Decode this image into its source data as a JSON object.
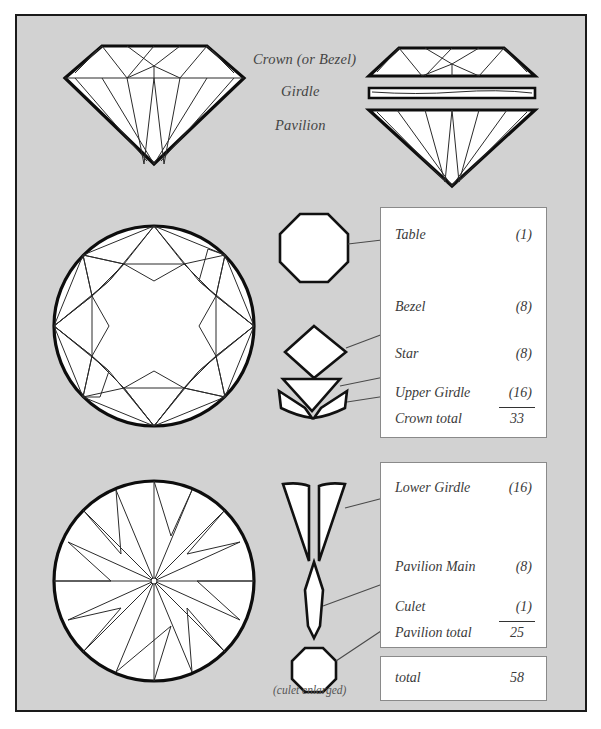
{
  "diagram": {
    "title_labels": {
      "crown": "Crown (or Bezel)",
      "girdle": "Girdle",
      "pavilion": "Pavilion"
    },
    "caption_culet": "(culet enlarged)",
    "background_color": "#d2d2d2",
    "frame_color": "#1a1a1a",
    "facet_fill": "#ffffff",
    "facet_stroke": "#0d0d0d"
  },
  "crown_table": {
    "rows": [
      {
        "name": "Table",
        "count": "(1)"
      },
      {
        "name": "Bezel",
        "count": "(8)"
      },
      {
        "name": "Star",
        "count": "(8)"
      },
      {
        "name": "Upper Girdle",
        "count": "(16)"
      }
    ],
    "total_label": "Crown total",
    "total_value": "33"
  },
  "pavilion_table": {
    "rows": [
      {
        "name": "Lower Girdle",
        "count": "(16)"
      },
      {
        "name": "Pavilion Main",
        "count": "(8)"
      },
      {
        "name": "Culet",
        "count": "(1)"
      }
    ],
    "total_label": "Pavilion total",
    "total_value": "25"
  },
  "grand_total": {
    "label": "total",
    "value": "58"
  },
  "shapes": {
    "side_view_whole": "diamond-side-view",
    "side_view_exploded": "diamond-exploded-view",
    "crown_top_view": "crown-plan-view",
    "pavilion_bottom_view": "pavilion-plan-view",
    "facet_table": "table-facet-octagon",
    "facet_bezel": "bezel-facet-kite",
    "facet_star": "star-facet-triangle",
    "facet_upper_girdle": "upper-girdle-facet-pair",
    "facet_lower_girdle": "lower-girdle-facet-pair",
    "facet_pavilion_main": "pavilion-main-facet",
    "facet_culet": "culet-facet-octagon"
  }
}
